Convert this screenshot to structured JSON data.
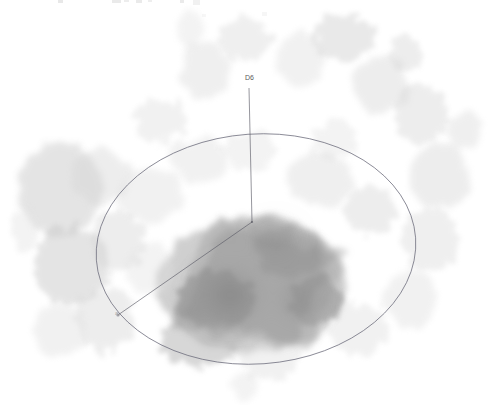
{
  "view": {
    "title": "volume-rendering",
    "width": 490,
    "height": 417,
    "background_color": "#ffffff"
  },
  "labels": {
    "top_axis": "D6",
    "lower_left_axis": "a"
  },
  "overlay": {
    "ellipse_stroke": "#6b6b7a",
    "axis_stroke": "#5a5a66",
    "center_point": {
      "x": 252,
      "y": 222
    },
    "ellipse": {
      "cx": 256,
      "cy": 249,
      "rx": 160,
      "ry": 115,
      "rotation_deg": -4
    },
    "top_axis_end": {
      "x": 249,
      "y": 88
    },
    "lower_left_axis_end": {
      "x": 118,
      "y": 315
    }
  },
  "chart_data": {
    "type": "heatmap",
    "title": "",
    "xlabel": "",
    "ylabel": "",
    "colormap": "grayscale-inverted",
    "value_range": [
      0,
      1
    ],
    "density_blobs": [
      {
        "x": 252,
        "y": 285,
        "rx": 95,
        "ry": 68,
        "intensity": 0.46
      },
      {
        "x": 215,
        "y": 300,
        "rx": 38,
        "ry": 30,
        "intensity": 0.6
      },
      {
        "x": 290,
        "y": 250,
        "rx": 34,
        "ry": 28,
        "intensity": 0.52
      },
      {
        "x": 318,
        "y": 300,
        "rx": 26,
        "ry": 24,
        "intensity": 0.55
      },
      {
        "x": 272,
        "y": 232,
        "rx": 22,
        "ry": 18,
        "intensity": 0.5
      },
      {
        "x": 200,
        "y": 340,
        "rx": 40,
        "ry": 26,
        "intensity": 0.4
      },
      {
        "x": 60,
        "y": 190,
        "rx": 42,
        "ry": 48,
        "intensity": 0.3
      },
      {
        "x": 72,
        "y": 265,
        "rx": 38,
        "ry": 40,
        "intensity": 0.3
      },
      {
        "x": 100,
        "y": 175,
        "rx": 30,
        "ry": 28,
        "intensity": 0.22
      },
      {
        "x": 118,
        "y": 240,
        "rx": 28,
        "ry": 30,
        "intensity": 0.22
      },
      {
        "x": 150,
        "y": 195,
        "rx": 34,
        "ry": 26,
        "intensity": 0.18
      },
      {
        "x": 105,
        "y": 320,
        "rx": 30,
        "ry": 32,
        "intensity": 0.22
      },
      {
        "x": 60,
        "y": 330,
        "rx": 26,
        "ry": 26,
        "intensity": 0.18
      },
      {
        "x": 160,
        "y": 120,
        "rx": 26,
        "ry": 22,
        "intensity": 0.18
      },
      {
        "x": 205,
        "y": 70,
        "rx": 24,
        "ry": 30,
        "intensity": 0.2
      },
      {
        "x": 245,
        "y": 40,
        "rx": 26,
        "ry": 22,
        "intensity": 0.2
      },
      {
        "x": 300,
        "y": 60,
        "rx": 24,
        "ry": 26,
        "intensity": 0.18
      },
      {
        "x": 345,
        "y": 38,
        "rx": 30,
        "ry": 24,
        "intensity": 0.26
      },
      {
        "x": 380,
        "y": 85,
        "rx": 30,
        "ry": 28,
        "intensity": 0.22
      },
      {
        "x": 420,
        "y": 115,
        "rx": 28,
        "ry": 30,
        "intensity": 0.22
      },
      {
        "x": 440,
        "y": 175,
        "rx": 30,
        "ry": 34,
        "intensity": 0.22
      },
      {
        "x": 430,
        "y": 240,
        "rx": 28,
        "ry": 32,
        "intensity": 0.2
      },
      {
        "x": 410,
        "y": 300,
        "rx": 26,
        "ry": 30,
        "intensity": 0.18
      },
      {
        "x": 360,
        "y": 330,
        "rx": 30,
        "ry": 26,
        "intensity": 0.18
      },
      {
        "x": 320,
        "y": 180,
        "rx": 34,
        "ry": 26,
        "intensity": 0.2
      },
      {
        "x": 370,
        "y": 210,
        "rx": 26,
        "ry": 24,
        "intensity": 0.22
      },
      {
        "x": 200,
        "y": 160,
        "rx": 30,
        "ry": 22,
        "intensity": 0.18
      },
      {
        "x": 250,
        "y": 150,
        "rx": 26,
        "ry": 20,
        "intensity": 0.16
      },
      {
        "x": 150,
        "y": 270,
        "rx": 24,
        "ry": 26,
        "intensity": 0.16
      },
      {
        "x": 270,
        "y": 360,
        "rx": 30,
        "ry": 20,
        "intensity": 0.18
      },
      {
        "x": 245,
        "y": 385,
        "rx": 14,
        "ry": 14,
        "intensity": 0.16
      },
      {
        "x": 405,
        "y": 55,
        "rx": 16,
        "ry": 18,
        "intensity": 0.22
      },
      {
        "x": 465,
        "y": 130,
        "rx": 16,
        "ry": 20,
        "intensity": 0.2
      },
      {
        "x": 25,
        "y": 230,
        "rx": 14,
        "ry": 22,
        "intensity": 0.16
      },
      {
        "x": 190,
        "y": 30,
        "rx": 14,
        "ry": 18,
        "intensity": 0.16
      },
      {
        "x": 335,
        "y": 140,
        "rx": 22,
        "ry": 20,
        "intensity": 0.16
      }
    ]
  }
}
